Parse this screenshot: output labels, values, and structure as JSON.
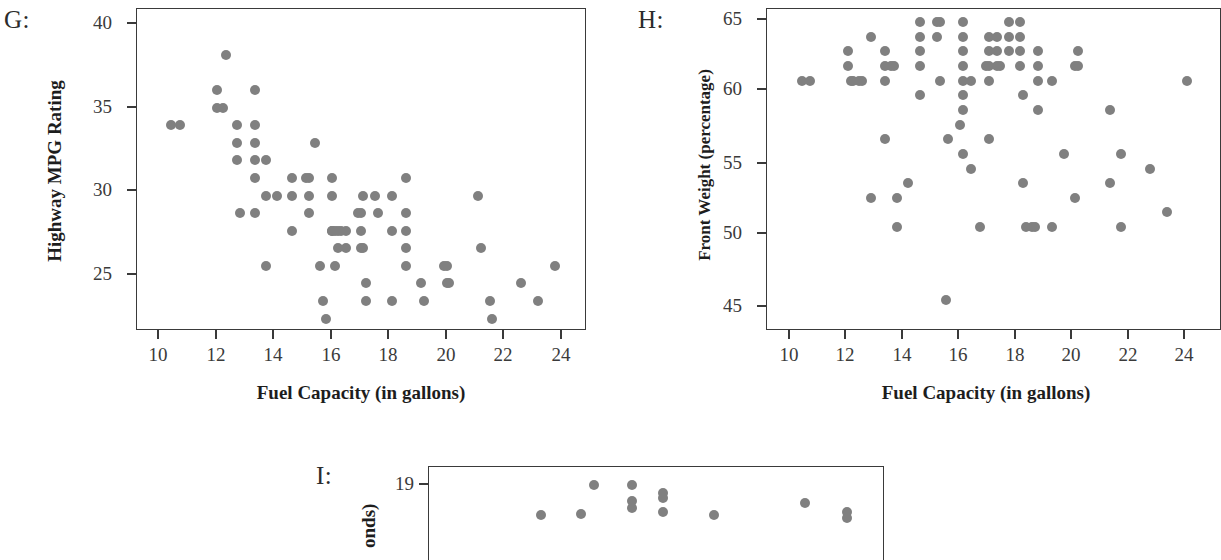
{
  "figure": {
    "background_color": "#ffffff",
    "point_color": "#808080",
    "axis_color": "#3a3a3a"
  },
  "panels": {
    "G": {
      "letter": "G:",
      "chart_data": {
        "type": "scatter",
        "title": "",
        "xlabel": "Fuel Capacity (in gallons)",
        "ylabel": "Highway MPG Rating",
        "xlim": [
          9.1,
          24.8
        ],
        "ylim": [
          22.3,
          40.6
        ],
        "xticks": [
          10,
          12,
          14,
          16,
          18,
          20,
          22,
          24
        ],
        "yticks": [
          25,
          30,
          35,
          40
        ],
        "grid": false,
        "legend": "none",
        "points": [
          [
            10.3,
            34
          ],
          [
            10.6,
            34
          ],
          [
            11.9,
            36
          ],
          [
            11.9,
            35
          ],
          [
            12.1,
            35
          ],
          [
            12.2,
            38
          ],
          [
            12.6,
            34
          ],
          [
            12.6,
            33
          ],
          [
            12.6,
            32
          ],
          [
            12.7,
            29
          ],
          [
            13.2,
            36
          ],
          [
            13.2,
            34
          ],
          [
            13.2,
            33
          ],
          [
            13.2,
            32
          ],
          [
            13.2,
            31
          ],
          [
            13.2,
            29
          ],
          [
            13.6,
            32
          ],
          [
            13.6,
            30
          ],
          [
            13.6,
            26
          ],
          [
            14.0,
            30
          ],
          [
            14.5,
            31
          ],
          [
            14.5,
            30
          ],
          [
            14.5,
            28
          ],
          [
            15.0,
            31
          ],
          [
            15.1,
            31
          ],
          [
            15.1,
            30
          ],
          [
            15.1,
            29
          ],
          [
            15.3,
            33
          ],
          [
            15.5,
            26
          ],
          [
            15.6,
            24
          ],
          [
            15.7,
            23
          ],
          [
            15.9,
            31
          ],
          [
            15.9,
            30
          ],
          [
            15.9,
            28
          ],
          [
            15.9,
            28
          ],
          [
            16.0,
            28
          ],
          [
            16.0,
            26
          ],
          [
            16.1,
            28
          ],
          [
            16.1,
            27
          ],
          [
            16.2,
            28
          ],
          [
            16.4,
            28
          ],
          [
            16.4,
            27
          ],
          [
            16.8,
            29
          ],
          [
            16.9,
            29
          ],
          [
            16.9,
            28
          ],
          [
            16.9,
            27
          ],
          [
            17.0,
            30
          ],
          [
            17.0,
            27
          ],
          [
            17.1,
            25
          ],
          [
            17.1,
            24
          ],
          [
            17.4,
            30
          ],
          [
            17.5,
            29
          ],
          [
            18.0,
            30
          ],
          [
            18.0,
            28
          ],
          [
            18.0,
            24
          ],
          [
            18.5,
            31
          ],
          [
            18.5,
            29
          ],
          [
            18.5,
            28
          ],
          [
            18.5,
            27
          ],
          [
            18.5,
            26
          ],
          [
            19.0,
            25
          ],
          [
            19.1,
            24
          ],
          [
            19.8,
            26
          ],
          [
            19.9,
            26
          ],
          [
            19.9,
            25
          ],
          [
            20.0,
            25
          ],
          [
            21.0,
            30
          ],
          [
            21.1,
            27
          ],
          [
            21.4,
            24
          ],
          [
            21.5,
            23
          ],
          [
            22.5,
            25
          ],
          [
            23.1,
            24
          ],
          [
            23.7,
            26
          ]
        ]
      }
    },
    "H": {
      "letter": "H:",
      "chart_data": {
        "type": "scatter",
        "title": "",
        "xlabel": "Fuel Capacity (in gallons)",
        "ylabel": "Front Weight (percentage)",
        "xlim": [
          9.1,
          24.9
        ],
        "ylim": [
          43.9,
          65.9
        ],
        "xticks": [
          10,
          12,
          14,
          16,
          18,
          20,
          22,
          24
        ],
        "yticks": [
          45,
          50,
          55,
          60,
          65
        ],
        "grid": false,
        "legend": "none",
        "points": [
          [
            10.3,
            61
          ],
          [
            10.6,
            61
          ],
          [
            11.9,
            63
          ],
          [
            11.9,
            62
          ],
          [
            12.0,
            61
          ],
          [
            12.1,
            61
          ],
          [
            12.3,
            61
          ],
          [
            12.4,
            61
          ],
          [
            12.7,
            64
          ],
          [
            12.7,
            53
          ],
          [
            13.2,
            63
          ],
          [
            13.2,
            62
          ],
          [
            13.2,
            61
          ],
          [
            13.2,
            57
          ],
          [
            13.4,
            62
          ],
          [
            13.5,
            62
          ],
          [
            13.6,
            53
          ],
          [
            13.6,
            51
          ],
          [
            14.0,
            54
          ],
          [
            14.4,
            65
          ],
          [
            14.4,
            64
          ],
          [
            14.4,
            63
          ],
          [
            14.4,
            62
          ],
          [
            14.4,
            60
          ],
          [
            15.0,
            65
          ],
          [
            15.1,
            65
          ],
          [
            15.0,
            64
          ],
          [
            15.1,
            61
          ],
          [
            15.3,
            46
          ],
          [
            15.4,
            57
          ],
          [
            15.9,
            65
          ],
          [
            15.9,
            64
          ],
          [
            15.9,
            63
          ],
          [
            15.9,
            62
          ],
          [
            15.9,
            61
          ],
          [
            15.9,
            60
          ],
          [
            15.9,
            59
          ],
          [
            15.8,
            58
          ],
          [
            15.9,
            56
          ],
          [
            16.2,
            61
          ],
          [
            16.2,
            55
          ],
          [
            16.5,
            51
          ],
          [
            16.7,
            62
          ],
          [
            16.8,
            62
          ],
          [
            16.8,
            64
          ],
          [
            16.8,
            63
          ],
          [
            16.8,
            61
          ],
          [
            16.8,
            57
          ],
          [
            17.1,
            64
          ],
          [
            17.1,
            63
          ],
          [
            17.1,
            62
          ],
          [
            17.2,
            62
          ],
          [
            17.5,
            65
          ],
          [
            17.5,
            64
          ],
          [
            17.5,
            63
          ],
          [
            17.9,
            65
          ],
          [
            17.9,
            64
          ],
          [
            17.9,
            63
          ],
          [
            17.9,
            62
          ],
          [
            18.0,
            60
          ],
          [
            18.0,
            54
          ],
          [
            18.1,
            51
          ],
          [
            18.3,
            51
          ],
          [
            18.4,
            51
          ],
          [
            18.5,
            63
          ],
          [
            18.5,
            62
          ],
          [
            18.5,
            61
          ],
          [
            18.5,
            59
          ],
          [
            19.0,
            61
          ],
          [
            19.0,
            51
          ],
          [
            19.4,
            56
          ],
          [
            19.8,
            62
          ],
          [
            19.8,
            53
          ],
          [
            19.9,
            62
          ],
          [
            19.9,
            63
          ],
          [
            21.0,
            59
          ],
          [
            21.0,
            54
          ],
          [
            21.4,
            56
          ],
          [
            21.4,
            51
          ],
          [
            22.4,
            55
          ],
          [
            23.0,
            52
          ],
          [
            23.7,
            61
          ]
        ]
      }
    },
    "I": {
      "letter": "I:",
      "chart_data": {
        "type": "scatter",
        "title": "",
        "xlabel": "",
        "ylabel": "onds)",
        "xlim": [
          0,
          12
        ],
        "ylim": [
          17.7,
          19.45
        ],
        "xticks": [],
        "yticks": [
          19
        ],
        "grid": false,
        "legend": "none",
        "note": "panel cropped by bottom edge of image",
        "points": [
          [
            4.35,
            19.12
          ],
          [
            5.35,
            19.12
          ],
          [
            5.35,
            18.82
          ],
          [
            5.35,
            18.68
          ],
          [
            6.15,
            18.97
          ],
          [
            6.15,
            18.87
          ],
          [
            6.15,
            18.62
          ],
          [
            2.95,
            18.55
          ],
          [
            4.0,
            18.57
          ],
          [
            7.5,
            18.55
          ],
          [
            9.9,
            18.78
          ],
          [
            11.0,
            18.62
          ],
          [
            11.0,
            18.5
          ]
        ]
      }
    }
  }
}
